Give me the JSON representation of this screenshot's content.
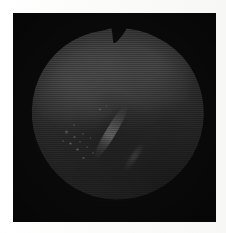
{
  "figure": {
    "kind": "halftone-printed grayscale retinal fundus photograph",
    "page_background": "#ffffff",
    "plate_background": "#050505",
    "caption": ""
  },
  "plate": {
    "x": 13,
    "y": 13,
    "width": 203,
    "height": 209,
    "color": "#050505"
  },
  "disc": {
    "label": "fundus-disc",
    "x": 28,
    "y": 28,
    "width": 176,
    "height": 179,
    "base_color": "#4a4a4a",
    "notch": {
      "label": "top-notch",
      "apex_x": 112,
      "apex_y": 42,
      "description": "V-shaped wedge cut into the superior rim of the circular image"
    }
  },
  "regions": [
    {
      "name": "superior-bright-field",
      "center": "44% 20%",
      "tone": "bright",
      "intensity": 0.46
    },
    {
      "name": "upper-left-bright-band",
      "center": "24% 30%",
      "tone": "bright",
      "intensity": 0.34
    },
    {
      "name": "upper-right-bright-lobe",
      "center": "74% 22%",
      "tone": "bright",
      "intensity": 0.3
    },
    {
      "name": "optic-disc-pale-patch",
      "center": "39% 47%",
      "tone": "pale",
      "intensity": 0.22
    },
    {
      "name": "macular-dark-zone",
      "center": "46% 56%",
      "tone": "dark",
      "intensity": 0.44
    },
    {
      "name": "inferior-nasal-shadow",
      "center": "26% 82%",
      "tone": "dark",
      "intensity": 0.46
    },
    {
      "name": "infero-temporal-dark-quadrant",
      "center": "74% 84%",
      "tone": "very-dark",
      "intensity": 0.72
    },
    {
      "name": "rim-vignette",
      "center": "50% 50%",
      "tone": "very-dark",
      "intensity": 0.78
    }
  ],
  "exudates": {
    "label": "exudate-cluster",
    "description": "cluster of small bright drusen/exudate dots left of the macula",
    "count": 14,
    "spots": [
      {
        "left": "22.0%",
        "top": "58.0%",
        "size": 3.4
      },
      {
        "left": "26.5%",
        "top": "61.0%",
        "size": 2.6
      },
      {
        "left": "24.0%",
        "top": "64.5%",
        "size": 3.0
      },
      {
        "left": "29.5%",
        "top": "63.5%",
        "size": 2.2
      },
      {
        "left": "31.0%",
        "top": "59.0%",
        "size": 2.0
      },
      {
        "left": "28.0%",
        "top": "68.0%",
        "size": 2.8
      },
      {
        "left": "33.5%",
        "top": "66.5%",
        "size": 2.0
      },
      {
        "left": "20.0%",
        "top": "63.0%",
        "size": 2.2
      },
      {
        "left": "35.5%",
        "top": "61.5%",
        "size": 1.8
      },
      {
        "left": "31.5%",
        "top": "72.5%",
        "size": 2.4
      },
      {
        "left": "37.0%",
        "top": "70.0%",
        "size": 1.8
      },
      {
        "left": "41.0%",
        "top": "45.5%",
        "size": 2.2
      },
      {
        "left": "44.5%",
        "top": "43.5%",
        "size": 1.6
      },
      {
        "left": "26.0%",
        "top": "54.0%",
        "size": 1.8
      }
    ]
  },
  "streaks": [
    {
      "name": "primary-specular-streak",
      "description": "bright diagonal light reflection running from upper-right to lower-left across the inferior macula",
      "angle_deg": 31,
      "center": "47% 58%"
    },
    {
      "name": "secondary-specular-streak",
      "description": "fainter short diagonal highlight below and right of the primary streak",
      "angle_deg": 34,
      "center": "60% 72%"
    }
  ],
  "halftone": {
    "name": "halftone-screen",
    "dot_pitch_px": 2,
    "description": "fine orthogonal halftone dot grid with horizontal scan banding, typical of a printed photographic reproduction"
  }
}
